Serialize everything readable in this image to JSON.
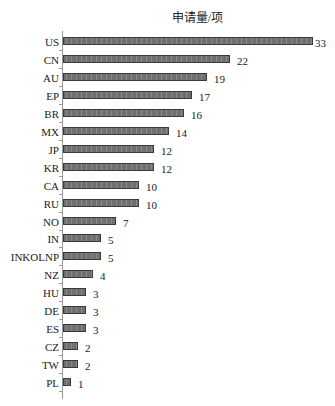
{
  "chart_data": {
    "type": "bar",
    "orientation": "horizontal",
    "title": "申请量/项",
    "xlabel": "申请量/项",
    "ylabel": "",
    "categories": [
      "US",
      "CN",
      "AU",
      "EP",
      "BR",
      "MX",
      "JP",
      "KR",
      "CA",
      "RU",
      "NO",
      "IN",
      "INKOLNP",
      "NZ",
      "HU",
      "DE",
      "ES",
      "CZ",
      "TW",
      "PL"
    ],
    "values": [
      33,
      22,
      19,
      17,
      16,
      14,
      12,
      12,
      10,
      10,
      7,
      5,
      5,
      4,
      3,
      3,
      3,
      2,
      2,
      1
    ],
    "xlim": [
      0,
      33
    ],
    "grid": false,
    "legend": null,
    "data_labels": true
  },
  "style": {
    "bar_color": "#7a7a7a",
    "bar_border": "#3a3a3a",
    "axis_color": "#9a9a9a"
  }
}
